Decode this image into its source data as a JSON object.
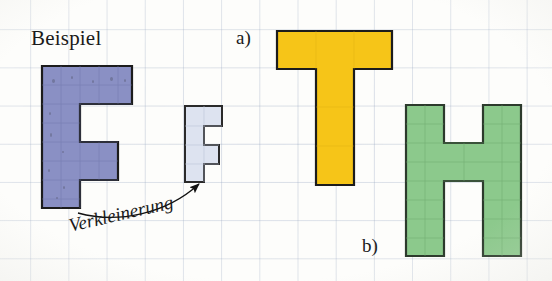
{
  "page": {
    "kind": "worksheet-scan",
    "width": 552,
    "height": 281,
    "background_color": "#fdfdfb",
    "grid_color": "#8a9cc0",
    "grid_cell_px": 38
  },
  "labels": {
    "beispiel": "Beispiel",
    "task_a": "a)",
    "task_b": "b)",
    "arrow_caption": "Verkleinerung"
  },
  "colors": {
    "blue_fill": "#8a90c4",
    "blue_stroke": "#1c1c1c",
    "pale_blue_fill": "#dde3f0",
    "pale_blue_stroke": "#2a2a2a",
    "yellow_fill": "#f6c518",
    "yellow_stroke": "#1c1c1c",
    "green_fill": "#8cc98c",
    "green_stroke": "#2c3a2c",
    "text": "#1a1a1a",
    "arrow": "#111111"
  },
  "shapes": [
    {
      "id": "big-f",
      "name": "letter-f-large-blue",
      "letter": "F",
      "fill": "#8a90c4",
      "stroke": "#1c1c1c",
      "grid_units": {
        "width": 2.5,
        "height": 4
      },
      "points": "42,66 132,66 132,104 80,104 80,142 118,142 118,180 80,180 80,208 42,208",
      "size_px": {
        "width": 90,
        "height": 142
      }
    },
    {
      "id": "small-f",
      "name": "letter-f-small-pale-blue",
      "letter": "F",
      "fill": "#dde3f0",
      "stroke": "#2a2a2a",
      "grid_units": {
        "width": 1.3,
        "height": 2
      },
      "points": "185,106 222,106 222,126 204,126 204,145 219,145 219,164 204,164 204,182 185,182",
      "size_px": {
        "width": 37,
        "height": 76
      }
    },
    {
      "id": "t-shape",
      "name": "letter-t-yellow",
      "letter": "T",
      "fill": "#f6c518",
      "stroke": "#1c1c1c",
      "grid_units": {
        "width": 3,
        "height": 4
      },
      "points": "277,31 392,31 392,69 354,69 354,185 316,185 316,69 277,69",
      "size_px": {
        "width": 115,
        "height": 154
      }
    },
    {
      "id": "h-shape",
      "name": "letter-h-green",
      "letter": "H",
      "fill": "#8cc98c",
      "stroke": "#2c3a2c",
      "grid_units": {
        "width": 3,
        "height": 4
      },
      "points": "406,105 444,105 444,143 483,143 483,105 521,105 521,256 483,256 483,181 444,181 444,256 406,256",
      "size_px": {
        "width": 115,
        "height": 151
      }
    }
  ],
  "annotation": {
    "name": "verkleinerung-arrow",
    "caption": "Verkleinerung",
    "from_shape": "big-f",
    "to_shape": "small-f",
    "path": "M 78,213 C 118,224 166,214 199,184",
    "arrowhead_at": {
      "x": 201,
      "y": 182
    }
  }
}
